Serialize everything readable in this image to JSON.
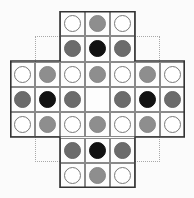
{
  "game": {
    "name": "peg-solitaire-board",
    "grid_size": 7,
    "cell_px": 25,
    "colors": {
      "white": "#ffffff",
      "light": "#8e8e8e",
      "dark": "#6b6b6b",
      "black": "#111111",
      "border": "#333333",
      "grid": "#8a8a8a",
      "dotted": "#a8a8a8"
    },
    "rows": [
      [
        "-",
        "-",
        "white",
        "light",
        "white",
        "-",
        "-"
      ],
      [
        "-",
        "-",
        "dark",
        "black",
        "dark",
        "-",
        "-"
      ],
      [
        "white",
        "light",
        "white",
        "light",
        "white",
        "light",
        "white"
      ],
      [
        "dark",
        "black",
        "dark",
        "empty",
        "dark",
        "black",
        "dark"
      ],
      [
        "white",
        "light",
        "white",
        "light",
        "white",
        "light",
        "white"
      ],
      [
        "-",
        "-",
        "dark",
        "black",
        "dark",
        "-",
        "-"
      ],
      [
        "-",
        "-",
        "white",
        "light",
        "white",
        "-",
        "-"
      ]
    ]
  }
}
